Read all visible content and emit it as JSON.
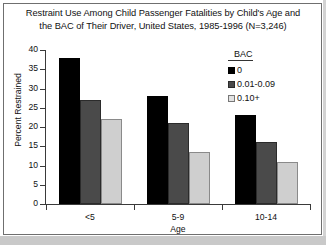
{
  "chart_data": {
    "type": "bar",
    "title": "Restraint Use Among Child Passenger Fatalities by Child's Age and the BAC of Their Driver, United States, 1985-1996 (N=3,246)",
    "title_line1": "Restraint Use Among Child Passenger Fatalities by Child's Age and",
    "title_line2": "the BAC of Their Driver, United States, 1985-1996 (N=3,246)",
    "xlabel": "Age",
    "ylabel": "Percent Restrained",
    "categories": [
      "<5",
      "5-9",
      "10-14"
    ],
    "ylim": [
      0,
      40
    ],
    "yticks": [
      0,
      5,
      10,
      15,
      20,
      25,
      30,
      35,
      40
    ],
    "ytick_labels": [
      "0",
      "5",
      "10",
      "15",
      "20",
      "25",
      "30",
      "35",
      "40"
    ],
    "grid": false,
    "legend_position": "top-right",
    "legend_title": "BAC",
    "series": [
      {
        "name": "0",
        "color": "#000000",
        "values": [
          38,
          28,
          23
        ]
      },
      {
        "name": "0.01-0.09",
        "color": "#4a4a4a",
        "values": [
          27,
          21,
          16
        ]
      },
      {
        "name": "0.10+",
        "color": "#cfcfcf",
        "values": [
          22,
          13.5,
          11
        ]
      }
    ]
  }
}
